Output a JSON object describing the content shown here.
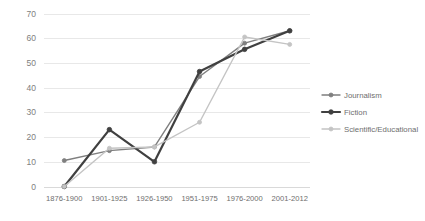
{
  "chart_data": {
    "type": "line",
    "title": "",
    "xlabel": "",
    "ylabel": "",
    "categories": [
      "1876-1900",
      "1901-1925",
      "1926-1950",
      "1951-1975",
      "1976-2000",
      "2001-2012"
    ],
    "ylim": [
      0,
      70
    ],
    "yticks": [
      0,
      10,
      20,
      30,
      40,
      50,
      60,
      70
    ],
    "ytick_labels": [
      "0",
      "10",
      "20",
      "30",
      "40",
      "50",
      "60",
      "70"
    ],
    "grid": true,
    "legend_position": "right",
    "series": [
      {
        "name": "Journalism",
        "color": "#7f7f7f",
        "width": 1.4,
        "marker": "circle",
        "values": [
          10.5,
          14.5,
          16.0,
          44.5,
          58.0,
          63.0
        ]
      },
      {
        "name": "Fiction",
        "color": "#404040",
        "width": 2.2,
        "marker": "circle",
        "values": [
          0.0,
          23.0,
          10.0,
          46.5,
          55.5,
          63.0
        ]
      },
      {
        "name": "Scientific/Educational",
        "color": "#c4c4c4",
        "width": 1.4,
        "marker": "circle",
        "values": [
          0.0,
          15.5,
          16.0,
          26.0,
          60.5,
          57.5
        ]
      }
    ]
  },
  "legend": {
    "entries": [
      {
        "label": "Journalism"
      },
      {
        "label": "Fiction"
      },
      {
        "label": "Scientific/Educational"
      }
    ]
  },
  "colors": {
    "journalism": "#7f7f7f",
    "fiction": "#404040",
    "scientific": "#c4c4c4",
    "grid": "#e8e8e8",
    "text": "#6e6e6e",
    "background": "#ffffff"
  }
}
